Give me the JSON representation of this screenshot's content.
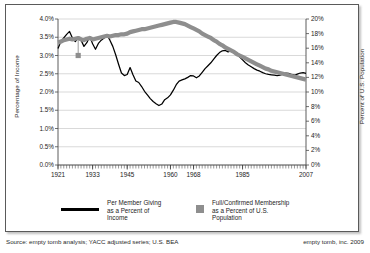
{
  "chart_data": {
    "type": "line",
    "title": "",
    "xlabel": "",
    "ylabel": "Percentage of Income",
    "y2label": "Percent of U.S. Population",
    "grid": true,
    "legend_position": "bottom",
    "xlim": [
      1921,
      2007
    ],
    "ylim": [
      0.0,
      4.0
    ],
    "y2lim": [
      0,
      20
    ],
    "xticks": [
      "1921",
      "1933",
      "1945",
      "1960",
      "1968",
      "1985",
      "2007"
    ],
    "xtick_values": [
      1921,
      1933,
      1945,
      1960,
      1968,
      1985,
      2007
    ],
    "yticks_left": [
      "0.0%",
      "0.5%",
      "1.0%",
      "1.5%",
      "2.0%",
      "2.5%",
      "3.0%",
      "3.5%",
      "4.0%"
    ],
    "ytick_left_values": [
      0.0,
      0.5,
      1.0,
      1.5,
      2.0,
      2.5,
      3.0,
      3.5,
      4.0
    ],
    "yticks_right": [
      "0%",
      "2%",
      "4%",
      "6%",
      "8%",
      "10%",
      "12%",
      "14%",
      "16%",
      "18%",
      "20%"
    ],
    "ytick_right_values": [
      0,
      2,
      4,
      6,
      8,
      10,
      12,
      14,
      16,
      18,
      20
    ],
    "series": [
      {
        "name": "Per Member Giving as a Percent of Income",
        "axis": "left",
        "color": "#000000",
        "style": "line",
        "x": [
          1921,
          1922,
          1923,
          1924,
          1925,
          1926,
          1927,
          1928,
          1929,
          1930,
          1931,
          1932,
          1933,
          1934,
          1935,
          1936,
          1937,
          1938,
          1939,
          1940,
          1941,
          1942,
          1943,
          1944,
          1945,
          1946,
          1947,
          1948,
          1949,
          1950,
          1951,
          1952,
          1953,
          1954,
          1955,
          1956,
          1957,
          1958,
          1959,
          1960,
          1961,
          1962,
          1963,
          1964,
          1965,
          1966,
          1967,
          1968,
          1969,
          1970,
          1971,
          1972,
          1973,
          1974,
          1975,
          1976,
          1977,
          1978,
          1979,
          1980,
          1981,
          1982,
          1983,
          1984,
          1985,
          1986,
          1987,
          1988,
          1989,
          1990,
          1991,
          1992,
          1993,
          1994,
          1995,
          1996,
          1997,
          1998,
          1999,
          2000,
          2001,
          2002,
          2003,
          2004,
          2005,
          2006,
          2007
        ],
        "y": [
          3.19,
          3.38,
          3.48,
          3.58,
          3.66,
          3.48,
          3.38,
          3.48,
          3.42,
          3.25,
          3.35,
          3.52,
          3.32,
          3.17,
          3.33,
          3.42,
          3.48,
          3.56,
          3.42,
          3.25,
          3.02,
          2.76,
          2.52,
          2.45,
          2.48,
          2.67,
          2.47,
          2.3,
          2.26,
          2.15,
          2.02,
          1.92,
          1.82,
          1.74,
          1.68,
          1.63,
          1.67,
          1.79,
          1.84,
          1.92,
          2.05,
          2.2,
          2.3,
          2.33,
          2.36,
          2.4,
          2.45,
          2.44,
          2.39,
          2.44,
          2.54,
          2.64,
          2.72,
          2.8,
          2.9,
          3.0,
          3.08,
          3.13,
          3.14,
          3.1,
          3.13,
          3.1,
          3.05,
          2.96,
          2.88,
          2.8,
          2.74,
          2.69,
          2.64,
          2.6,
          2.57,
          2.53,
          2.5,
          2.48,
          2.47,
          2.46,
          2.45,
          2.46,
          2.49,
          2.52,
          2.51,
          2.48,
          2.46,
          2.49,
          2.52,
          2.53,
          2.51
        ],
        "note": "Per member giving as a percent of income, 1921-2007"
      },
      {
        "name": "Full/Confirmed Membership as a Percent of U.S. Population",
        "axis": "right",
        "color": "#8e8e8e",
        "style": "thick-line",
        "x": [
          1921,
          1922,
          1923,
          1924,
          1925,
          1926,
          1927,
          1928,
          1929,
          1930,
          1931,
          1932,
          1933,
          1934,
          1935,
          1936,
          1937,
          1938,
          1939,
          1940,
          1941,
          1942,
          1943,
          1944,
          1945,
          1946,
          1947,
          1948,
          1949,
          1950,
          1951,
          1952,
          1953,
          1954,
          1955,
          1956,
          1957,
          1958,
          1959,
          1960,
          1961,
          1962,
          1963,
          1964,
          1965,
          1966,
          1967,
          1968,
          1969,
          1970,
          1971,
          1972,
          1973,
          1974,
          1975,
          1976,
          1977,
          1978,
          1979,
          1980,
          1981,
          1982,
          1983,
          1984,
          1985,
          1986,
          1987,
          1988,
          1989,
          1990,
          1991,
          1992,
          1993,
          1994,
          1995,
          1996,
          1997,
          1998,
          1999,
          2000,
          2001,
          2002,
          2003,
          2004,
          2005,
          2006,
          2007
        ],
        "y": [
          16.8,
          16.9,
          17.1,
          17.2,
          17.3,
          17.2,
          17.3,
          17.4,
          17.2,
          17.1,
          17.3,
          17.4,
          17.2,
          17.3,
          17.4,
          17.5,
          17.6,
          17.7,
          17.6,
          17.7,
          17.8,
          17.8,
          17.9,
          17.9,
          18.0,
          18.2,
          18.3,
          18.4,
          18.5,
          18.6,
          18.6,
          18.7,
          18.8,
          18.9,
          19.0,
          19.1,
          19.2,
          19.3,
          19.4,
          19.5,
          19.6,
          19.6,
          19.5,
          19.4,
          19.3,
          19.1,
          18.9,
          18.7,
          18.5,
          18.3,
          18.0,
          17.8,
          17.6,
          17.4,
          17.1,
          16.9,
          16.6,
          16.4,
          16.1,
          15.9,
          15.7,
          15.5,
          15.2,
          15.0,
          14.8,
          14.6,
          14.4,
          14.2,
          14.0,
          13.8,
          13.6,
          13.4,
          13.2,
          13.1,
          12.9,
          12.8,
          12.7,
          12.6,
          12.5,
          12.4,
          12.3,
          12.2,
          12.1,
          12.0,
          11.9,
          11.8,
          11.7
        ],
        "note": "Full or confirmed membership as a percent of U.S. population, 1921-2007"
      }
    ],
    "annotations": [
      {
        "name": "membership-drop-marker",
        "type": "marker-with-dropline",
        "x": 1928,
        "y_right": 15.0,
        "color": "#8e8e8e",
        "label": ""
      }
    ]
  },
  "legend": {
    "items": [
      {
        "swatch": "line",
        "color": "#000000",
        "label": "Per Member Giving\nas a Percent of\nIncome"
      },
      {
        "swatch": "square",
        "color": "#8e8e8e",
        "label": "Full/Confirmed Membership\nas a Percent of U.S.\nPopulation"
      }
    ]
  },
  "footer": {
    "source": "Source: empty tomb analysis; YACC adjusted series; U.S. BEA",
    "credit": "empty tomb, inc. 2009"
  }
}
